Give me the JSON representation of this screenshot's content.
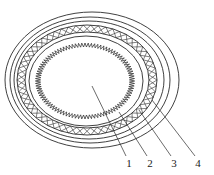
{
  "figure": {
    "type": "cable-cross-section-diagram",
    "background_color": "#ffffff",
    "line_color": "#2b2b2b",
    "canvas": {
      "width": 214,
      "height": 175
    }
  },
  "layers": [
    {
      "id": "conductor",
      "name": "central-conductor",
      "shape": "rectangle",
      "cx": 85,
      "cy": 81,
      "width": 51,
      "height": 30,
      "fill": "#ffffff",
      "stroke": "#2b2b2b"
    },
    {
      "id": "insulation",
      "name": "serrated-insulation-ring",
      "shape": "ellipse-sawtooth",
      "cx": 85,
      "cy": 81,
      "rx": 47,
      "ry": 36,
      "teeth": 96,
      "tooth_depth": 2.6,
      "fill": "#ffffff",
      "stroke": "#2b2b2b"
    },
    {
      "id": "bedding",
      "name": "bedding-ring",
      "shape": "ellipse",
      "cx": 86,
      "cy": 81,
      "rx": 57,
      "ry": 45,
      "fill": "none",
      "stroke": "#2b2b2b"
    },
    {
      "id": "braid",
      "name": "braided-armour-band",
      "shape": "ellipse-band-crosshatch",
      "cx": 87,
      "cy": 80,
      "rx_outer": 70,
      "ry_outer": 55,
      "rx_inner": 62,
      "ry_inner": 48,
      "hatch_cells": 58,
      "fill": "#ffffff",
      "stroke": "#2b2b2b"
    },
    {
      "id": "inner-sheath",
      "name": "inner-sheath-ring",
      "shape": "ellipse",
      "cx": 89,
      "cy": 80,
      "rx": 75,
      "ry": 59,
      "fill": "none",
      "stroke": "#2b2b2b"
    },
    {
      "id": "mid-sheath",
      "name": "middle-sheath-ring",
      "shape": "ellipse",
      "cx": 90,
      "cy": 80,
      "rx": 80,
      "ry": 63,
      "fill": "none",
      "stroke": "#2b2b2b"
    },
    {
      "id": "outer-sheath",
      "name": "outer-sheath-ring",
      "shape": "ellipse",
      "cx": 92,
      "cy": 80,
      "rx": 87,
      "ry": 68,
      "fill": "none",
      "stroke": "#2b2b2b"
    }
  ],
  "callouts": [
    {
      "label": "1",
      "label_x": 129,
      "label_y": 167,
      "line_x1": 126,
      "line_y1": 156,
      "line_x2": 92,
      "line_y2": 86,
      "target": "central-conductor"
    },
    {
      "label": "2",
      "label_x": 150,
      "label_y": 167,
      "line_x1": 147,
      "line_y1": 156,
      "line_x2": 119,
      "line_y2": 112,
      "target": "bedding-ring"
    },
    {
      "label": "3",
      "label_x": 174,
      "label_y": 167,
      "line_x1": 171,
      "line_y1": 156,
      "line_x2": 139,
      "line_y2": 110,
      "target": "inner-sheath-ring"
    },
    {
      "label": "4",
      "label_x": 198,
      "label_y": 167,
      "line_x1": 195,
      "line_y1": 156,
      "line_x2": 152,
      "line_y2": 100,
      "target": "outer-sheath-ring"
    }
  ]
}
